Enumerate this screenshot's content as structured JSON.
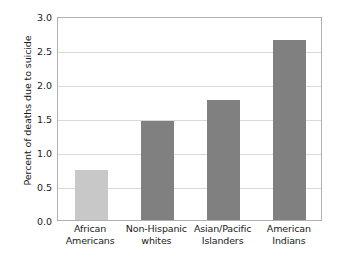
{
  "chart_data": {
    "type": "bar",
    "title": "",
    "xlabel": "",
    "ylabel": "Percent of deaths due to suicide",
    "categories": [
      "African Americans",
      "Non-Hispanic whites",
      "Asian/Pacific Islanders",
      "American Indians"
    ],
    "category_lines": [
      [
        "African",
        "Americans"
      ],
      [
        "Non-Hispanic",
        "whites"
      ],
      [
        "Asian/Pacific",
        "Islanders"
      ],
      [
        "American",
        "Indians"
      ]
    ],
    "values": [
      0.73,
      1.45,
      1.77,
      2.65
    ],
    "bar_colors": [
      "#c8c8c8",
      "#808080",
      "#808080",
      "#808080"
    ],
    "ylim": [
      0.0,
      3.0
    ],
    "yticks": [
      0.0,
      0.5,
      1.0,
      1.5,
      2.0,
      2.5,
      3.0
    ],
    "ytick_labels": [
      "0.0",
      "0.5",
      "1.0",
      "1.5",
      "2.0",
      "2.5",
      "3.0"
    ],
    "grid": true,
    "grid_axis": "y",
    "grid_color": "#d9d9d9",
    "legend": false,
    "frame_color": "#b0b0b0",
    "background": "#ffffff"
  }
}
